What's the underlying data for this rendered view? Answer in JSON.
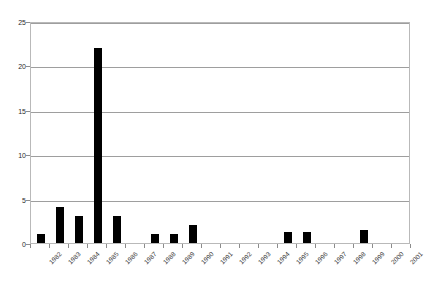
{
  "chart_data": {
    "type": "bar",
    "title": "",
    "subtitle": "",
    "xlabel": "",
    "ylabel": "",
    "categories": [
      "1982",
      "1983",
      "1984",
      "1985",
      "1986",
      "1987",
      "1988",
      "1989",
      "1990",
      "1991",
      "1992",
      "1993",
      "1994",
      "1995",
      "1996",
      "1997",
      "1998",
      "1999",
      "2000",
      "2001"
    ],
    "values": [
      1,
      4,
      3,
      22,
      3,
      0,
      1,
      1,
      2,
      0,
      0,
      0,
      0,
      1.2,
      1.2,
      0,
      0,
      1.5,
      0,
      0
    ],
    "ylim": [
      0,
      25
    ],
    "ytick_labels": [
      "0",
      "5",
      "10",
      "15",
      "20",
      "25"
    ],
    "ytick_values": [
      0,
      5,
      10,
      15,
      20,
      25
    ],
    "grid": "horizontal",
    "legend": "none",
    "bar_color": "#000000",
    "gridline_color": "#9e9e9e",
    "plot_border_color": "#b9b9b9",
    "background_color": "#ffffff",
    "axis_text_color": "#2b2b2b"
  }
}
